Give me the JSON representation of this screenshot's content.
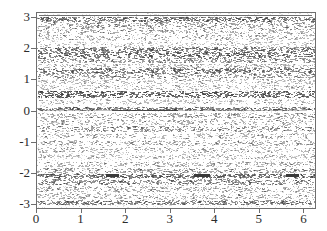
{
  "chart_data": {
    "type": "scatter",
    "title": "",
    "xlabel": "",
    "ylabel": "",
    "xlim": [
      0,
      6.2832
    ],
    "ylim": [
      -3.15,
      3.15
    ],
    "grid": false,
    "legend": null,
    "xticks": [
      "0",
      "1",
      "2",
      "3",
      "4",
      "5",
      "6"
    ],
    "xtick_values": [
      0,
      1,
      2,
      3,
      4,
      5,
      6
    ],
    "yticks": [
      "3",
      "2",
      "1",
      "0",
      "-1",
      "-2",
      "-3"
    ],
    "ytick_values": [
      3,
      2,
      1,
      0,
      -1,
      -2,
      -3
    ],
    "bands": [
      {
        "y_center": 2.95,
        "half_height": 0.07,
        "density": 0.8,
        "darkness": 0.62
      },
      {
        "y_center": 2.78,
        "half_height": 0.1,
        "density": 0.55,
        "darkness": 0.45
      },
      {
        "y_center": 2.58,
        "half_height": 0.1,
        "density": 0.48,
        "darkness": 0.4
      },
      {
        "y_center": 2.36,
        "half_height": 0.09,
        "density": 0.42,
        "darkness": 0.36
      },
      {
        "y_center": 2.14,
        "half_height": 0.08,
        "density": 0.3,
        "darkness": 0.28
      },
      {
        "y_center": 1.97,
        "half_height": 0.07,
        "density": 0.72,
        "darkness": 0.58
      },
      {
        "y_center": 1.8,
        "half_height": 0.09,
        "density": 0.78,
        "darkness": 0.66
      },
      {
        "y_center": 1.62,
        "half_height": 0.08,
        "density": 0.6,
        "darkness": 0.5
      },
      {
        "y_center": 1.43,
        "half_height": 0.07,
        "density": 0.4,
        "darkness": 0.34
      },
      {
        "y_center": 1.28,
        "half_height": 0.08,
        "density": 0.7,
        "darkness": 0.6
      },
      {
        "y_center": 1.12,
        "half_height": 0.08,
        "density": 0.55,
        "darkness": 0.46
      },
      {
        "y_center": 0.93,
        "half_height": 0.08,
        "density": 0.38,
        "darkness": 0.32
      },
      {
        "y_center": 0.74,
        "half_height": 0.08,
        "density": 0.34,
        "darkness": 0.3
      },
      {
        "y_center": 0.52,
        "half_height": 0.11,
        "density": 0.88,
        "darkness": 0.74
      },
      {
        "y_center": 0.28,
        "half_height": 0.08,
        "density": 0.36,
        "darkness": 0.3
      },
      {
        "y_center": 0.05,
        "half_height": 0.05,
        "density": 0.7,
        "darkness": 0.55
      },
      {
        "y_center": -0.17,
        "half_height": 0.08,
        "density": 0.5,
        "darkness": 0.42
      },
      {
        "y_center": -0.38,
        "half_height": 0.09,
        "density": 0.44,
        "darkness": 0.37
      },
      {
        "y_center": -0.6,
        "half_height": 0.09,
        "density": 0.58,
        "darkness": 0.48
      },
      {
        "y_center": -0.82,
        "half_height": 0.08,
        "density": 0.4,
        "darkness": 0.34
      },
      {
        "y_center": -1.05,
        "half_height": 0.08,
        "density": 0.46,
        "darkness": 0.38
      },
      {
        "y_center": -1.28,
        "half_height": 0.08,
        "density": 0.4,
        "darkness": 0.34
      },
      {
        "y_center": -1.5,
        "half_height": 0.08,
        "density": 0.36,
        "darkness": 0.31
      },
      {
        "y_center": -1.74,
        "half_height": 0.08,
        "density": 0.44,
        "darkness": 0.37
      },
      {
        "y_center": -1.95,
        "half_height": 0.08,
        "density": 0.52,
        "darkness": 0.44
      },
      {
        "y_center": -2.12,
        "half_height": 0.07,
        "density": 0.76,
        "darkness": 0.64
      },
      {
        "y_center": -2.32,
        "half_height": 0.09,
        "density": 0.66,
        "darkness": 0.55
      },
      {
        "y_center": -2.55,
        "half_height": 0.09,
        "density": 0.48,
        "darkness": 0.4
      },
      {
        "y_center": -2.78,
        "half_height": 0.09,
        "density": 0.44,
        "darkness": 0.37
      },
      {
        "y_center": -2.98,
        "half_height": 0.07,
        "density": 0.7,
        "darkness": 0.58
      }
    ],
    "dark_segments": [
      {
        "y": 0.0,
        "x_start": 1.7,
        "x_end": 3.18,
        "weight": 1.6
      },
      {
        "y": 0.0,
        "x_start": 3.18,
        "x_end": 6.1,
        "weight": 0.5
      },
      {
        "y": 0.0,
        "x_start": 0.05,
        "x_end": 1.7,
        "weight": 0.5
      },
      {
        "y": -2.1,
        "x_start": 1.55,
        "x_end": 1.85,
        "weight": 2.2
      },
      {
        "y": -2.1,
        "x_start": 3.55,
        "x_end": 3.92,
        "weight": 2.2
      },
      {
        "y": -2.1,
        "x_start": 5.62,
        "x_end": 5.92,
        "weight": 2.2
      },
      {
        "y": 3.08,
        "x_start": 0.05,
        "x_end": 6.22,
        "weight": 1.0
      }
    ],
    "point_color": "#3a3a3a",
    "axis_color": "#6e6e6e",
    "background_color": "#ffffff"
  }
}
